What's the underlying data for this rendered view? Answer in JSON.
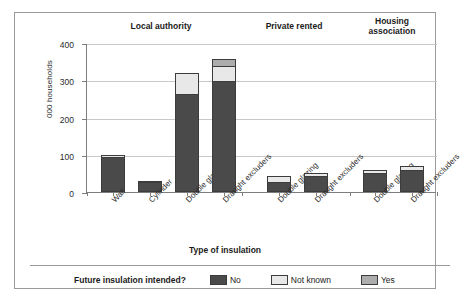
{
  "chart_data": {
    "type": "bar",
    "subtype": "stacked-bar-grouped",
    "title": "",
    "xlabel": "Type of insulation",
    "ylabel": "000 households",
    "ylim": [
      0,
      400
    ],
    "yticks": [
      0,
      100,
      200,
      300,
      400
    ],
    "grid": true,
    "legend_position": "bottom",
    "legend_title": "Future insulation intended?",
    "series": [
      {
        "name": "No",
        "color": "#4a4a4a",
        "values": [
          93,
          27,
          263,
          297,
          28,
          43,
          52,
          58
        ]
      },
      {
        "name": "Not known",
        "color": "#e8e8e8",
        "values": [
          7,
          3,
          57,
          41,
          15,
          8,
          8,
          12
        ]
      },
      {
        "name": "Yes",
        "color": "#adadad",
        "values": [
          0,
          0,
          0,
          20,
          0,
          0,
          0,
          0
        ]
      }
    ],
    "categories": [
      "Wall",
      "Cylinder",
      "Double glazing",
      "Draught excluders",
      "Double glazing",
      "Draught excluders",
      "Double glazing",
      "Draught excluders"
    ],
    "totals": [
      100,
      30,
      320,
      358,
      43,
      51,
      60,
      70
    ],
    "groups": [
      {
        "label": "Local authority",
        "bar_indices": [
          0,
          1,
          2,
          3
        ]
      },
      {
        "label": "Private rented",
        "bar_indices": [
          4,
          5
        ]
      },
      {
        "label": "Housing\nassociation",
        "bar_indices": [
          6,
          7
        ]
      }
    ]
  },
  "axes": {
    "y_title": "000 households",
    "x_title": "Type of insulation",
    "y_tick_labels": [
      "400",
      "300",
      "200",
      "100",
      "0"
    ]
  },
  "groups": {
    "g0": "Local authority",
    "g1": "Private rented",
    "g2": "Housing\nassociation"
  },
  "categories": {
    "c0": "Wall",
    "c1": "Cylinder",
    "c2": "Double glazing",
    "c3": "Draught excluders",
    "c4": "Double glazing",
    "c5": "Draught excluders",
    "c6": "Double glazing",
    "c7": "Draught excluders"
  },
  "legend": {
    "title": "Future insulation intended?",
    "items": [
      {
        "label": "No",
        "color": "#4a4a4a"
      },
      {
        "label": "Not known",
        "color": "#e8e8e8"
      },
      {
        "label": "Yes",
        "color": "#adadad"
      }
    ]
  }
}
